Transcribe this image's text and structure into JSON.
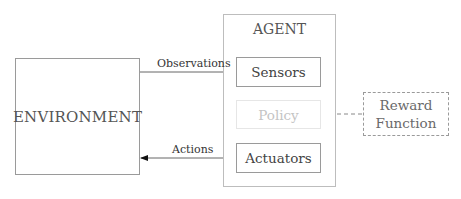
{
  "diagram": {
    "environment": {
      "label": "ENVIRONMENT"
    },
    "agent": {
      "title": "AGENT",
      "components": [
        {
          "id": "sensors",
          "label": "Sensors"
        },
        {
          "id": "policy",
          "label": "Policy",
          "faded": true
        },
        {
          "id": "actuators",
          "label": "Actuators"
        }
      ]
    },
    "reward": {
      "line1": "Reward",
      "line2": "Function",
      "style": "dashed"
    },
    "edges": [
      {
        "from": "environment",
        "to": "sensors",
        "label": "Observations",
        "style": "solid"
      },
      {
        "from": "sensors",
        "to": "policy",
        "label": "",
        "style": "solid"
      },
      {
        "from": "policy",
        "to": "actuators",
        "label": "",
        "style": "solid"
      },
      {
        "from": "actuators",
        "to": "environment",
        "label": "Actions",
        "style": "solid"
      },
      {
        "from": "reward",
        "to": "policy",
        "label": "",
        "style": "dashed"
      }
    ],
    "colors": {
      "box_border": "#9a9a9a",
      "faded": "#c4c4c4",
      "text": "#555555",
      "arrow": "#111111"
    }
  }
}
